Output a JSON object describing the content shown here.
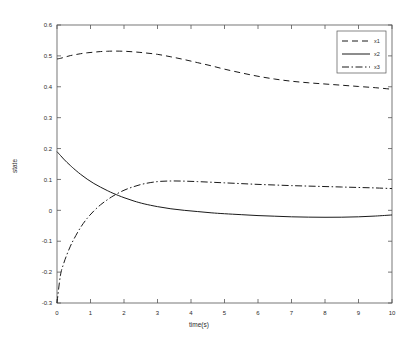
{
  "chart_data": {
    "type": "line",
    "title": "",
    "xlabel": "time(s)",
    "ylabel": "state",
    "xlim": [
      0,
      10
    ],
    "ylim": [
      -0.3,
      0.6
    ],
    "grid": false,
    "legend_position": "top-right",
    "xticks": [
      "0",
      "1",
      "2",
      "3",
      "4",
      "5",
      "6",
      "7",
      "8",
      "9",
      "10"
    ],
    "xtick_values": [
      0,
      1,
      2,
      3,
      4,
      5,
      6,
      7,
      8,
      9,
      10
    ],
    "yticks": [
      "0.6",
      "0.5",
      "0.4",
      "0.3",
      "0.2",
      "0.1",
      "0",
      "-0.1",
      "-0.2",
      "-0.3"
    ],
    "ytick_values": [
      0.6,
      0.5,
      0.4,
      0.3,
      0.2,
      0.1,
      0,
      -0.1,
      -0.2,
      -0.3
    ],
    "x": [
      0,
      0.1,
      0.2,
      0.3,
      0.4,
      0.5,
      0.7,
      0.9,
      1.1,
      1.3,
      1.5,
      1.7,
      2.0,
      2.3,
      2.6,
      3.0,
      3.4,
      3.8,
      4.2,
      4.6,
      5.0,
      5.5,
      6.0,
      6.5,
      7.0,
      7.5,
      8.0,
      8.5,
      9.0,
      9.5,
      10.0
    ],
    "series": [
      {
        "name": "x1",
        "style": "dashed",
        "color": "#1a1a1a",
        "values": [
          0.49,
          0.492,
          0.495,
          0.498,
          0.501,
          0.503,
          0.507,
          0.51,
          0.512,
          0.514,
          0.515,
          0.5155,
          0.515,
          0.513,
          0.51,
          0.505,
          0.497,
          0.488,
          0.478,
          0.468,
          0.457,
          0.445,
          0.434,
          0.425,
          0.418,
          0.413,
          0.409,
          0.405,
          0.401,
          0.397,
          0.392
        ]
      },
      {
        "name": "x2",
        "style": "solid",
        "color": "#1a1a1a",
        "values": [
          0.19,
          0.178,
          0.166,
          0.155,
          0.145,
          0.135,
          0.117,
          0.101,
          0.087,
          0.075,
          0.064,
          0.054,
          0.041,
          0.03,
          0.021,
          0.012,
          0.005,
          0.0,
          -0.004,
          -0.008,
          -0.011,
          -0.014,
          -0.017,
          -0.019,
          -0.021,
          -0.022,
          -0.0225,
          -0.0222,
          -0.021,
          -0.0185,
          -0.015
        ]
      },
      {
        "name": "x3",
        "style": "dashdot",
        "color": "#1a1a1a",
        "values": [
          -0.3,
          -0.212,
          -0.172,
          -0.142,
          -0.116,
          -0.094,
          -0.056,
          -0.026,
          -0.002,
          0.018,
          0.034,
          0.048,
          0.065,
          0.077,
          0.086,
          0.093,
          0.095,
          0.0945,
          0.093,
          0.091,
          0.089,
          0.0865,
          0.084,
          0.082,
          0.08,
          0.0785,
          0.077,
          0.0755,
          0.074,
          0.0725,
          0.0705
        ]
      }
    ],
    "annotations": {
      "x1_initial": 0.49,
      "x1_peak": 0.5155,
      "x1_final": 0.392,
      "x2_initial": 0.19,
      "x2_min": -0.0225,
      "x2_final": -0.015,
      "x3_initial": -0.3,
      "x3_peak": 0.095,
      "x3_final": 0.0705
    }
  },
  "legend": {
    "entries": [
      {
        "label": "x1"
      },
      {
        "label": "x2"
      },
      {
        "label": "x3"
      }
    ]
  }
}
